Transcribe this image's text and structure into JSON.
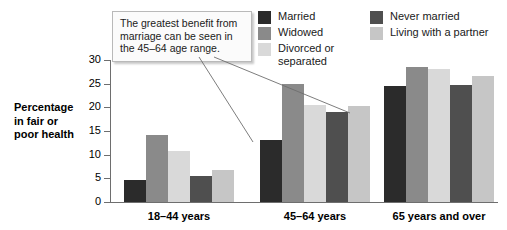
{
  "chart_data": {
    "type": "bar",
    "title": "",
    "xlabel": "",
    "ylabel": "Percentage in fair or poor health",
    "ylim": [
      0,
      30
    ],
    "yticks": [
      "0",
      "5",
      "10",
      "15",
      "20",
      "25",
      "30"
    ],
    "grid": false,
    "legend_position": "top-right",
    "categories": [
      "18–44 years",
      "45–64 years",
      "65 years and over"
    ],
    "series": [
      {
        "name": "Married",
        "color": "#2b2b2b",
        "values": [
          4.6,
          13.0,
          24.5
        ]
      },
      {
        "name": "Widowed",
        "color": "#8a8a8a",
        "values": [
          14.2,
          25.0,
          28.5
        ]
      },
      {
        "name": "Divorced or\nseparated",
        "color": "#d9d9d9",
        "values": [
          10.7,
          20.5,
          28.2
        ]
      },
      {
        "name": "Never married",
        "color": "#4f4f4f",
        "values": [
          5.4,
          19.0,
          24.7
        ]
      },
      {
        "name": "Living with a partner",
        "color": "#c6c6c6",
        "values": [
          6.8,
          20.3,
          26.7
        ]
      }
    ],
    "annotations": [
      {
        "text": "The greatest benefit from marriage can be seen in the 45–64 age range.",
        "points_to": [
          "45–64 years / Married",
          "45–64 years / Never married"
        ]
      }
    ]
  },
  "axis": {
    "y_title_line1": "Percentage",
    "y_title_line2": "in fair or",
    "y_title_line3": "poor health"
  },
  "legend": {
    "left_column": [
      {
        "label": "Married",
        "color": "#2b2b2b"
      },
      {
        "label": "Widowed",
        "color": "#8a8a8a"
      },
      {
        "label": "Divorced or\nseparated",
        "color": "#d9d9d9"
      }
    ],
    "right_column": [
      {
        "label": "Never married",
        "color": "#4f4f4f"
      },
      {
        "label": "Living with a partner",
        "color": "#c6c6c6"
      }
    ]
  },
  "callout": {
    "text": "The greatest benefit from marriage can be seen in the 45–64 age range."
  },
  "colors": {
    "axis": "#6e6e6e",
    "text": "#000000",
    "callout_border": "#b9b9b9",
    "callout_bg": "#fbfbfb",
    "leader_line": "#6e6e6e"
  }
}
